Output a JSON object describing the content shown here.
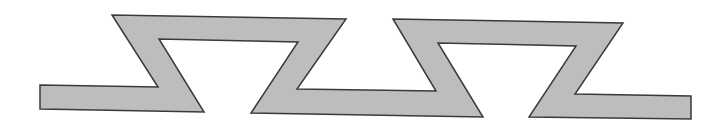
{
  "diagram": {
    "type": "zigzag-band",
    "fill": "#bdbdbd",
    "stroke": "#3a3a3a",
    "stroke_width": 1.5,
    "points": "40,85 158,87 112,15 346,19 297,89 436,91 393,19 623,23 575,94 691,96 691,119 529,117 576,46 438,43 483,117 251,113 298,42 159,39 204,112 40,109"
  }
}
